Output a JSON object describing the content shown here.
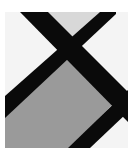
{
  "image": {
    "description": "Close-up of a grey-and-white tiled pattern divided by thick black diagonal bands forming an X",
    "colors": {
      "background": "#ffffff",
      "panel_white": "#f4f4f4",
      "top_triangle": "#d8d8d8",
      "gray_panel": "#9a9a9a",
      "band": "#0a0a0a"
    }
  }
}
